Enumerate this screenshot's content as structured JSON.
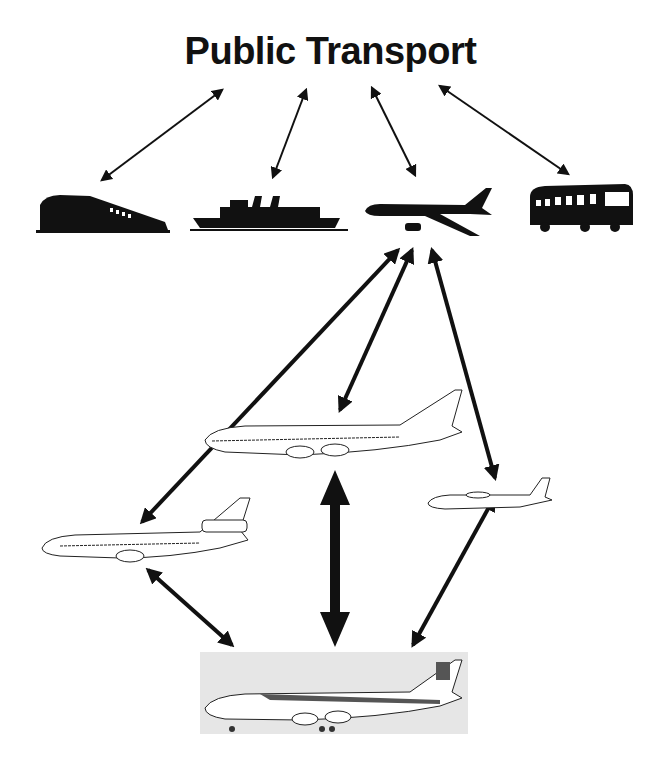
{
  "title": "Public Transport",
  "nodes": {
    "top": [
      {
        "id": "train",
        "label": "Train"
      },
      {
        "id": "ship",
        "label": "Ship"
      },
      {
        "id": "airplane",
        "label": "Airplane"
      },
      {
        "id": "bus",
        "label": "Bus"
      }
    ],
    "aircraft": [
      {
        "id": "jumbo-jet",
        "label": "Wide-body jet (747)"
      },
      {
        "id": "trijet",
        "label": "Trijet (DC-10)"
      },
      {
        "id": "turboprop",
        "label": "Turboprop"
      },
      {
        "id": "iberia-747",
        "label": "Iberia 747 photo"
      }
    ]
  },
  "edges": [
    {
      "from": "title",
      "to": "train"
    },
    {
      "from": "title",
      "to": "ship"
    },
    {
      "from": "title",
      "to": "airplane"
    },
    {
      "from": "title",
      "to": "bus"
    },
    {
      "from": "airplane",
      "to": "trijet"
    },
    {
      "from": "airplane",
      "to": "jumbo-jet"
    },
    {
      "from": "airplane",
      "to": "turboprop"
    },
    {
      "from": "jumbo-jet",
      "to": "iberia-747"
    },
    {
      "from": "trijet",
      "to": "iberia-747"
    },
    {
      "from": "turboprop",
      "to": "iberia-747"
    }
  ],
  "colors": {
    "ink": "#111111",
    "photo_bg": "#e6e6e6"
  }
}
